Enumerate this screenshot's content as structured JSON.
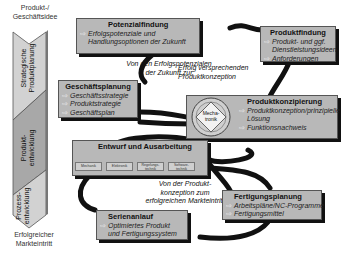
{
  "side": {
    "start_label": "Produkt-/\nGeschäftsidee",
    "end_label": "Erfolgreicher\nMarkteintritt",
    "phases": [
      {
        "label": "Strategische Produktplanung",
        "line1": "Strategische",
        "line2": "Produktplanung",
        "color": "#c9c9c9"
      },
      {
        "label": "Produktentwicklung",
        "line1": "Produkt-",
        "line2": "entwicklung",
        "color": "#a9a9a9"
      },
      {
        "label": "Prozessentwicklung",
        "line1": "Prozess-",
        "line2": "entwicklung",
        "color": "#c9c9c9"
      }
    ]
  },
  "boxes": {
    "potenzialfindung": {
      "title": "Potenzialfindung",
      "items": [
        "Erfolgspotenziale und",
        "Handlungsoptionen der Zukunft"
      ]
    },
    "produktfindung": {
      "title": "Produktfindung",
      "items": [
        "Produkt- und ggf.",
        "Dienstleistungsideen",
        "Anforderungen"
      ]
    },
    "geschaeftsplanung": {
      "title": "Geschäftsplanung",
      "items": [
        "Geschäftsstrategie",
        "Produktstrategie",
        "Geschäftsplan"
      ]
    },
    "produktkonzipierung": {
      "title": "Produktkonzipierung",
      "items": [
        "Produktkonzeption/prinzipielle",
        "Lösung",
        "Funktionsnachweis"
      ],
      "mechatronik": "Mecha-\ntronik"
    },
    "entwurf": {
      "title": "Entwurf und Ausarbeitung",
      "chips": [
        "Mechanik",
        "Elektronik",
        "Regelungs-\ntechnik",
        "Software-\ntechnik"
      ]
    },
    "fertigungsplanung": {
      "title": "Fertigungsplanung",
      "items": [
        "Arbeitspläne/NC-Programme",
        "Fertigungsmittel"
      ]
    },
    "serienanlauf": {
      "title": "Serienanlauf",
      "items": [
        "Optimiertes Produkt",
        "und Fertigungssystem"
      ]
    }
  },
  "notes": {
    "note1": "Von den Erfolgspotenzialen\nder Zukunft zur",
    "note2": "Erfolg versprechenden\nProduktkonzeption",
    "note3": "Von der Produkt-\nkonzeption zum\nerfolgreichen Markteintritt"
  },
  "arrow_glyph": "⇨"
}
